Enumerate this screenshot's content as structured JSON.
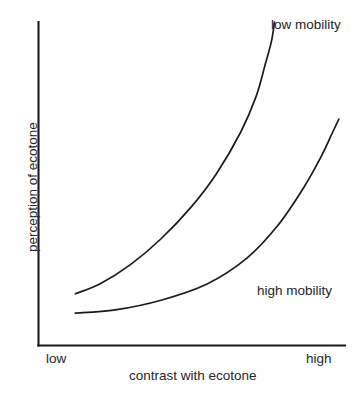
{
  "chart_data": {
    "type": "line",
    "title": "",
    "subtitle": "",
    "xlabel": "contrast with ecotone",
    "ylabel": "perception of ecotone",
    "xlim": [
      0,
      1
    ],
    "ylim": [
      0,
      1
    ],
    "grid": false,
    "legend_position": "inline-annotation",
    "x_tick_labels": [
      "low",
      "high"
    ],
    "y_tick_labels": [],
    "annotations": [
      "low mobility",
      "high mobility"
    ],
    "series": [
      {
        "name": "low mobility",
        "label": "low mobility",
        "x": [
          0.12,
          0.2,
          0.3,
          0.4,
          0.5,
          0.58,
          0.66,
          0.71,
          0.74,
          0.76,
          0.77
        ],
        "y": [
          0.16,
          0.19,
          0.25,
          0.33,
          0.43,
          0.53,
          0.66,
          0.77,
          0.87,
          0.94,
          1.0
        ]
      },
      {
        "name": "high mobility",
        "label": "high mobility",
        "x": [
          0.12,
          0.25,
          0.4,
          0.55,
          0.68,
          0.78,
          0.86,
          0.92,
          0.96,
          0.98
        ],
        "y": [
          0.1,
          0.11,
          0.14,
          0.19,
          0.27,
          0.37,
          0.48,
          0.58,
          0.66,
          0.7
        ]
      }
    ]
  },
  "axes": {
    "x_title": "contrast with ecotone",
    "y_title": "perception of ecotone",
    "x_tick_low": "low",
    "x_tick_high": "high"
  },
  "labels": {
    "low_mobility": "low mobility",
    "high_mobility": "high mobility"
  },
  "colors": {
    "background": "#ffffff",
    "ink": "#1b1b1b",
    "text": "#262626"
  }
}
